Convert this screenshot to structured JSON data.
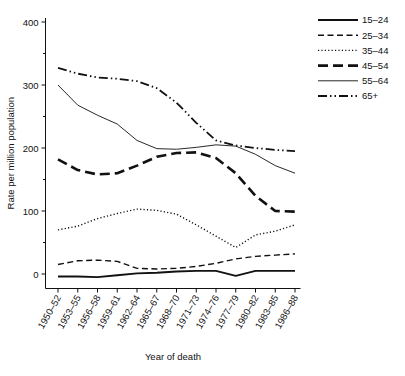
{
  "chart_data": {
    "type": "line",
    "title": "",
    "xlabel": "Year of death",
    "ylabel": "Rate per million population",
    "categories": [
      "1950–52",
      "1953–55",
      "1956–58",
      "1959–61",
      "1962–64",
      "1965–67",
      "1968–70",
      "1971–73",
      "1974–76",
      "1977–79",
      "1980–82",
      "1983–85",
      "1986–88"
    ],
    "ylim": [
      0,
      400
    ],
    "yticks": [
      0,
      100,
      200,
      300,
      400
    ],
    "ytick_labels": [
      "0",
      "100",
      "200",
      "300",
      "400"
    ],
    "grid": false,
    "legend_position": "top-right outside",
    "series": [
      {
        "name": "15–24",
        "style": "solid-thick",
        "values": [
          -4,
          -4,
          -5,
          -2,
          1,
          2,
          4,
          5,
          5,
          -3,
          5,
          5,
          5
        ]
      },
      {
        "name": "25–34",
        "style": "dashed",
        "values": [
          15,
          21,
          22,
          20,
          9,
          8,
          9,
          12,
          17,
          24,
          28,
          30,
          32
        ]
      },
      {
        "name": "35–44",
        "style": "dotted",
        "values": [
          70,
          76,
          88,
          96,
          103,
          101,
          95,
          78,
          60,
          42,
          62,
          68,
          78
        ]
      },
      {
        "name": "45–54",
        "style": "longdash-thick",
        "values": [
          182,
          165,
          158,
          160,
          172,
          186,
          192,
          193,
          184,
          160,
          124,
          100,
          99
        ]
      },
      {
        "name": "55–64",
        "style": "solid-thin",
        "values": [
          300,
          268,
          252,
          238,
          212,
          199,
          198,
          201,
          205,
          203,
          190,
          172,
          160
        ]
      },
      {
        "name": "65+",
        "style": "dash-dot-dot",
        "values": [
          327,
          318,
          312,
          310,
          306,
          295,
          272,
          240,
          212,
          204,
          200,
          197,
          195
        ]
      }
    ]
  },
  "legend": {
    "items": [
      {
        "label": "15–24"
      },
      {
        "label": "25–34"
      },
      {
        "label": "35–44"
      },
      {
        "label": "45–54"
      },
      {
        "label": "55–64"
      },
      {
        "label": "65+"
      }
    ]
  }
}
